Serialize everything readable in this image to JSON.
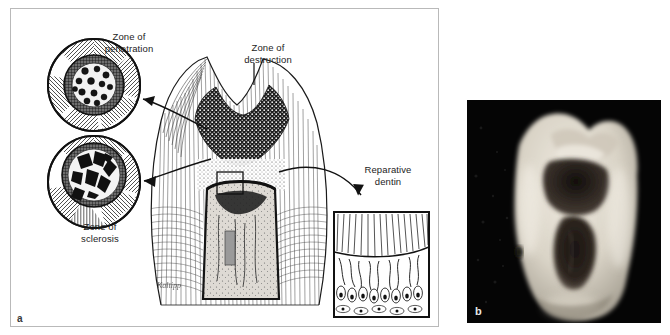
{
  "figure": {
    "panels": [
      {
        "id": "a",
        "label": "a",
        "type": "illustration",
        "caption_labels": [
          {
            "key": "zone_penetration",
            "text": "Zone of\npenetration"
          },
          {
            "key": "zone_destruction",
            "text": "Zone of\ndestruction"
          },
          {
            "key": "zone_sclerosis",
            "text": "Zone of\nsclerosis"
          },
          {
            "key": "reparative_dentin",
            "text": "Reparative\ndentin"
          }
        ],
        "signature": "Kaltipp",
        "insets": [
          {
            "name": "penetration-inset",
            "shape": "circle",
            "content": "bacteria-filled dentinal tubules"
          },
          {
            "name": "sclerosis-inset",
            "shape": "circle",
            "content": "sclerotic mineral crystals"
          },
          {
            "name": "reparative-dentin-inset",
            "shape": "rectangle",
            "content": "tubules with odontoblast layer"
          }
        ]
      },
      {
        "id": "b",
        "label": "b",
        "type": "photograph",
        "content": "sectioned molar tooth with dark carious lesion"
      }
    ]
  },
  "colors": {
    "page_background": "#ffffff",
    "panel_border": "#b9b9b9",
    "ink": "#1a1a1a",
    "photo_background": "#050505",
    "photo_tooth_light": "#e4e0d8",
    "photo_lesion_dark": "#241c18"
  }
}
